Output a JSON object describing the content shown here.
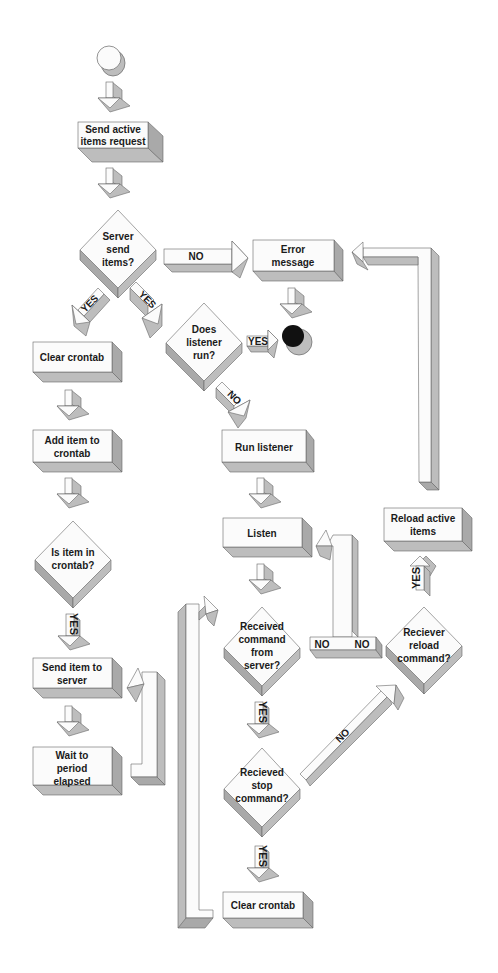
{
  "diagram": {
    "type": "flowchart",
    "style": {
      "face": "#fbfbfb",
      "shade": "#bdbdbd",
      "shade_dark": "#a9a9a9",
      "stroke": "#555555",
      "end_node": "#111111"
    },
    "nodes": {
      "start": {
        "kind": "start-circle"
      },
      "send_request": {
        "line1": "Send active",
        "line2": "items request"
      },
      "server_send": {
        "line1": "Server",
        "line2": "send",
        "line3": "items?"
      },
      "error_message": {
        "line1": "Error",
        "line2": "message"
      },
      "end": {
        "kind": "end-circle"
      },
      "clear_crontab_1": {
        "line1": "Clear crontab"
      },
      "does_listener_run": {
        "line1": "Does",
        "line2": "listener",
        "line3": "run?"
      },
      "add_item": {
        "line1": "Add item to",
        "line2": "crontab"
      },
      "run_listener": {
        "line1": "Run listener"
      },
      "is_item_in_crontab": {
        "line1": "Is item in",
        "line2": "crontab?"
      },
      "listen": {
        "line1": "Listen"
      },
      "reload_active_items": {
        "line1": "Reload active",
        "line2": "items"
      },
      "send_item": {
        "line1": "Send item to",
        "line2": "server"
      },
      "received_command": {
        "line1": "Received",
        "line2": "command",
        "line3": "from",
        "line4": "server?"
      },
      "reciever_reload": {
        "line1": "Reciever",
        "line2": "reload",
        "line3": "command?"
      },
      "wait_period": {
        "line1": "Wait to",
        "line2": "period",
        "line3": "elapsed"
      },
      "recieved_stop": {
        "line1": "Recieved",
        "line2": "stop",
        "line3": "command?"
      },
      "clear_crontab_2": {
        "line1": "Clear crontab"
      }
    },
    "edges": {
      "server_no": "NO",
      "server_yes_left": "YES",
      "server_yes_right": "YES",
      "listener_yes": "YES",
      "listener_no": "NO",
      "item_in_crontab_yes": "YES",
      "received_command_yes": "YES",
      "received_command_no_1": "NO",
      "received_command_no_2": "NO",
      "stop_no": "NO",
      "stop_yes": "YES",
      "reload_yes": "YES"
    }
  }
}
